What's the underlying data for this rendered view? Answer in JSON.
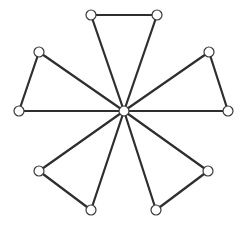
{
  "diagram": {
    "type": "windmill-graph",
    "style": {
      "edge_color": "#2e2e2e",
      "node_fill": "#ffffff",
      "node_stroke": "#3a3a3a",
      "background": "#ffffff",
      "node_radius": 5
    },
    "nodes": [
      {
        "id": "c",
        "x": 124,
        "y": 111
      },
      {
        "id": "t1",
        "x": 91,
        "y": 15
      },
      {
        "id": "t2",
        "x": 157,
        "y": 15
      },
      {
        "id": "r1",
        "x": 209,
        "y": 52
      },
      {
        "id": "r2",
        "x": 228,
        "y": 111
      },
      {
        "id": "b1",
        "x": 208,
        "y": 171
      },
      {
        "id": "b2",
        "x": 156,
        "y": 210
      },
      {
        "id": "b3",
        "x": 91,
        "y": 210
      },
      {
        "id": "b4",
        "x": 39,
        "y": 171
      },
      {
        "id": "l1",
        "x": 19,
        "y": 111
      },
      {
        "id": "l2",
        "x": 39,
        "y": 52
      }
    ],
    "edges": [
      [
        "c",
        "t1"
      ],
      [
        "c",
        "t2"
      ],
      [
        "t1",
        "t2"
      ],
      [
        "c",
        "r1"
      ],
      [
        "c",
        "r2"
      ],
      [
        "r1",
        "r2"
      ],
      [
        "c",
        "b1"
      ],
      [
        "c",
        "b2"
      ],
      [
        "b1",
        "b2"
      ],
      [
        "c",
        "b3"
      ],
      [
        "c",
        "b4"
      ],
      [
        "b3",
        "b4"
      ],
      [
        "c",
        "l1"
      ],
      [
        "c",
        "l2"
      ],
      [
        "l1",
        "l2"
      ]
    ]
  }
}
